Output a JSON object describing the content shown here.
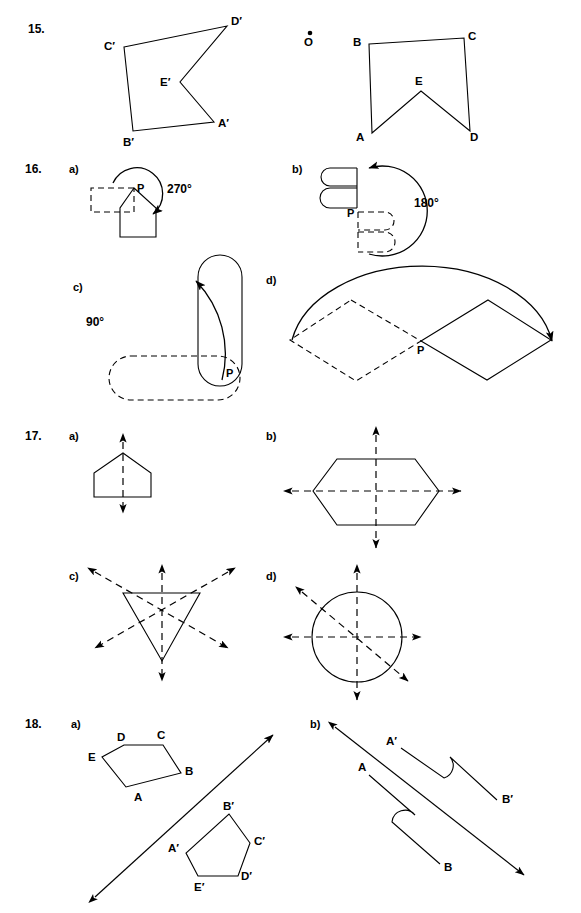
{
  "page": {
    "width": 581,
    "height": 913,
    "background": "#ffffff",
    "ink": "#000000"
  },
  "problems": [
    {
      "number": "15.",
      "parts": [],
      "figures": [
        {
          "id": "q15-left",
          "type": "polygon-image",
          "labels": [
            "C'",
            "D'",
            "E'",
            "A'",
            "B'"
          ]
        },
        {
          "id": "q15-right",
          "type": "polygon-preimage",
          "labels": [
            "B",
            "C",
            "E",
            "A",
            "D"
          ],
          "center_point": "O"
        }
      ]
    },
    {
      "number": "16.",
      "parts": [
        {
          "label": "a)",
          "angle": "270°",
          "center": "P"
        },
        {
          "label": "b)",
          "angle": "180°",
          "center": "P"
        },
        {
          "label": "c)",
          "angle": "90°",
          "center": "P"
        },
        {
          "label": "d)",
          "angle": "",
          "center": "P"
        }
      ]
    },
    {
      "number": "17.",
      "parts": [
        {
          "label": "a)",
          "shape": "pentagon",
          "lines_of_symmetry": 1
        },
        {
          "label": "b)",
          "shape": "hexagon",
          "lines_of_symmetry": 2
        },
        {
          "label": "c)",
          "shape": "triangle",
          "lines_of_symmetry": 3
        },
        {
          "label": "d)",
          "shape": "circle",
          "lines_of_symmetry": 3
        }
      ]
    },
    {
      "number": "18.",
      "parts": [
        {
          "label": "a)",
          "preimage_labels": [
            "D",
            "C",
            "B",
            "E",
            "A"
          ],
          "image_labels": [
            "B'",
            "C'",
            "A'",
            "D'",
            "E'"
          ]
        },
        {
          "label": "b)",
          "preimage_labels": [
            "A",
            "B"
          ],
          "image_labels": [
            "A'",
            "B'"
          ]
        }
      ]
    }
  ],
  "labels": {
    "q15": {
      "num": "15.",
      "left": {
        "c": "C′",
        "d": "D′",
        "e": "E′",
        "a": "A′",
        "b": "B′"
      },
      "right": {
        "o": "O",
        "b": "B",
        "c": "C",
        "e": "E",
        "a": "A",
        "d": "D"
      }
    },
    "q16": {
      "num": "16.",
      "a": {
        "part": "a)",
        "angle": "270°",
        "p": "P"
      },
      "b": {
        "part": "b)",
        "angle": "180°",
        "p": "P"
      },
      "c": {
        "part": "c)",
        "angle": "90°",
        "p": "P"
      },
      "d": {
        "part": "d)",
        "p": "P"
      }
    },
    "q17": {
      "num": "17.",
      "a": {
        "part": "a)"
      },
      "b": {
        "part": "b)"
      },
      "c": {
        "part": "c)"
      },
      "d": {
        "part": "d)"
      }
    },
    "q18": {
      "num": "18.",
      "a": {
        "part": "a)",
        "d": "D",
        "c": "C",
        "b": "B",
        "e": "E",
        "a": "A",
        "bp": "B′",
        "cp": "C′",
        "ap": "A′",
        "dp": "D′",
        "ep": "E′"
      },
      "b": {
        "part": "b)",
        "ap": "A′",
        "bp": "B′",
        "a": "A",
        "b": "B"
      }
    }
  }
}
